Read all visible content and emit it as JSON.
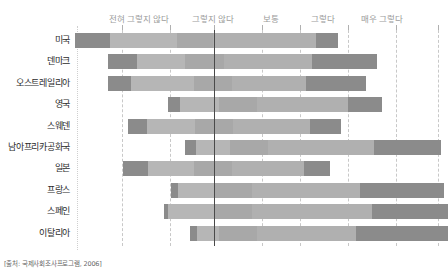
{
  "source_note": "[출처: 국제사회조사프로그램, 2006]",
  "scale": {
    "labels": [
      {
        "text": "전혀 그렇지 않다",
        "x": 139
      },
      {
        "text": "그렇지 않다",
        "x": 213
      },
      {
        "text": "보통",
        "x": 271
      },
      {
        "text": "그렇다",
        "x": 323
      },
      {
        "text": "매우 그렇다",
        "x": 382
      }
    ]
  },
  "axis": {
    "center_x": 136,
    "gridlines": [
      44,
      92,
      136,
      184,
      222,
      270,
      318,
      360
    ],
    "solid_gridline": 136
  },
  "colors": {
    "strongly_disagree": "#8b8b8b",
    "disagree": "#b6b6b6",
    "neutral": "#a8a8a8",
    "agree": "#b0b0b0",
    "strongly_agree": "#8b8b8b",
    "gridline": "#c8c8c8",
    "center_line": "#4a4a4a",
    "label_text": "#2b2b2b",
    "scale_text": "#9a9a9a"
  },
  "chart_data": {
    "type": "bar",
    "title": "",
    "subtitle": "",
    "xlabel": "",
    "ylabel": "",
    "orientation": "horizontal",
    "stacked": true,
    "diverging": true,
    "grid": true,
    "legend_position": "top",
    "categories": [
      "미국",
      "덴마크",
      "오스트레일리아",
      "영국",
      "스웨덴",
      "남아프리카공화국",
      "일본",
      "프랑스",
      "스페인",
      "이탈리아"
    ],
    "series": [
      {
        "name": "전혀 그렇지 않다",
        "values": [
          14.5,
          12.0,
          9.5,
          5.0,
          8.0,
          4.5,
          10.5,
          3.0,
          2.0,
          3.0
        ]
      },
      {
        "name": "그렇지 않다",
        "values": [
          28.0,
          20.0,
          26.0,
          16.0,
          20.0,
          14.0,
          19.0,
          15.0,
          19.0,
          9.0
        ]
      },
      {
        "name": "보통",
        "values": [
          15.0,
          16.0,
          16.0,
          16.0,
          16.0,
          16.0,
          16.0,
          16.0,
          16.0,
          16.0
        ]
      },
      {
        "name": "그렇다",
        "values": [
          43.0,
          37.0,
          31.0,
          38.0,
          32.0,
          44.0,
          30.0,
          45.0,
          50.0,
          41.0
        ]
      },
      {
        "name": "매우 그렇다",
        "values": [
          9.0,
          27.0,
          25.0,
          14.0,
          13.0,
          28.0,
          11.0,
          35.0,
          37.0,
          42.0
        ]
      }
    ],
    "bars": [
      {
        "label": "미국",
        "start": -58,
        "segments": [
          14.5,
          28.0,
          15.0,
          43.0,
          9.0
        ]
      },
      {
        "label": "덴마크",
        "start": -44,
        "segments": [
          12.0,
          20.0,
          16.0,
          37.0,
          27.0
        ]
      },
      {
        "label": "오스트레일리아",
        "start": -44,
        "segments": [
          9.5,
          26.0,
          16.0,
          31.0,
          25.0
        ]
      },
      {
        "label": "영국",
        "start": -19,
        "segments": [
          5.0,
          16.0,
          16.0,
          38.0,
          14.0
        ]
      },
      {
        "label": "스웨덴",
        "start": -36,
        "segments": [
          8.0,
          20.0,
          16.0,
          32.0,
          13.0
        ]
      },
      {
        "label": "남아프리카공화국",
        "start": -12,
        "segments": [
          4.5,
          14.0,
          16.0,
          44.0,
          28.0
        ]
      },
      {
        "label": "일본",
        "start": -38,
        "segments": [
          10.5,
          19.0,
          16.0,
          30.0,
          11.0
        ]
      },
      {
        "label": "프랑스",
        "start": -18,
        "segments": [
          3.0,
          15.0,
          16.0,
          45.0,
          35.0
        ]
      },
      {
        "label": "스페인",
        "start": -21,
        "segments": [
          2.0,
          19.0,
          16.0,
          50.0,
          37.0
        ]
      },
      {
        "label": "이탈리아",
        "start": -10,
        "segments": [
          3.0,
          9.0,
          16.0,
          41.0,
          42.0
        ]
      }
    ],
    "segment_names": [
      "전혀 그렇지 않다",
      "그렇지 않다",
      "보통",
      "그렇다",
      "매우 그렇다"
    ]
  }
}
